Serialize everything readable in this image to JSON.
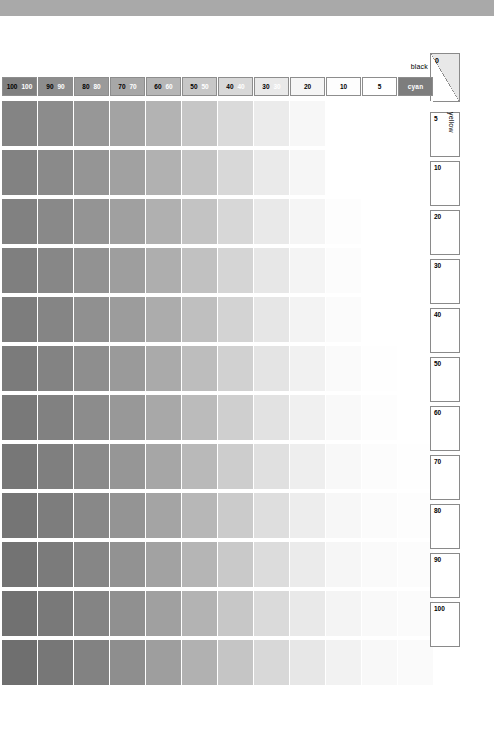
{
  "page": {
    "top_band_color": "#a9a9a9",
    "background": "#ffffff"
  },
  "labels": {
    "black": "black",
    "yellow": "yellow",
    "zero": "0"
  },
  "header": {
    "cells": [
      {
        "dark": "100",
        "light": "100",
        "fill": "#808080",
        "cyan": false
      },
      {
        "dark": "90",
        "light": "90",
        "fill": "#8d8d8d",
        "cyan": false
      },
      {
        "dark": "80",
        "light": "80",
        "fill": "#9a9a9a",
        "cyan": false
      },
      {
        "dark": "70",
        "light": "70",
        "fill": "#a7a7a7",
        "cyan": false
      },
      {
        "dark": "60",
        "light": "60",
        "fill": "#b6b6b6",
        "cyan": false
      },
      {
        "dark": "50",
        "light": "50",
        "fill": "#c7c7c7",
        "cyan": false
      },
      {
        "dark": "40",
        "light": "40",
        "fill": "#d8d8d8",
        "cyan": false
      },
      {
        "dark": "30",
        "light": "30",
        "fill": "#e9e9e9",
        "cyan": false
      },
      {
        "dark": "20",
        "light": "",
        "fill": "#f5f5f5",
        "cyan": false
      },
      {
        "dark": "10",
        "light": "",
        "fill": "#fdfdfd",
        "cyan": false
      },
      {
        "dark": "5",
        "light": "",
        "fill": "#ffffff",
        "cyan": false
      },
      {
        "dark": "cyan",
        "light": "",
        "fill": "#7d7d7d",
        "cyan": true
      }
    ]
  },
  "side_column": {
    "cells": [
      "5",
      "10",
      "20",
      "30",
      "40",
      "50",
      "60",
      "70",
      "80",
      "90",
      "100"
    ]
  },
  "chart_data": {
    "type": "heatmap",
    "xlabel": "cyan",
    "ylabel": "yellow",
    "x_categories": [
      "100",
      "90",
      "80",
      "70",
      "60",
      "50",
      "40",
      "30",
      "20",
      "10",
      "5",
      "cyan"
    ],
    "y_categories": [
      "0",
      "5",
      "10",
      "20",
      "30",
      "40",
      "50",
      "60",
      "70",
      "80",
      "90",
      "100"
    ],
    "grid": false,
    "legend": "none",
    "rows": [
      [
        "#848484",
        "#8c8c8c",
        "#979797",
        "#a3a3a3",
        "#b3b3b3",
        "#c6c6c6",
        "#dadada",
        "#ebebeb",
        "#f7f7f7",
        "#ffffff",
        "#ffffff",
        "#ffffff"
      ],
      [
        "#828282",
        "#8a8a8a",
        "#959595",
        "#a1a1a1",
        "#b1b1b1",
        "#c4c4c4",
        "#d8d8d8",
        "#eaeaea",
        "#f6f6f6",
        "#ffffff",
        "#ffffff",
        "#ffffff"
      ],
      [
        "#818181",
        "#898989",
        "#949494",
        "#a0a0a0",
        "#b0b0b0",
        "#c3c3c3",
        "#d7d7d7",
        "#e9e9e9",
        "#f5f5f5",
        "#fdfdfd",
        "#ffffff",
        "#ffffff"
      ],
      [
        "#7f7f7f",
        "#878787",
        "#929292",
        "#9e9e9e",
        "#aeaeae",
        "#c1c1c1",
        "#d5d5d5",
        "#e7e7e7",
        "#f4f4f4",
        "#fcfcfc",
        "#ffffff",
        "#ffffff"
      ],
      [
        "#7d7d7d",
        "#858585",
        "#909090",
        "#9c9c9c",
        "#acacac",
        "#bfbfbf",
        "#d3d3d3",
        "#e6e6e6",
        "#f3f3f3",
        "#fbfbfb",
        "#ffffff",
        "#ffffff"
      ],
      [
        "#7b7b7b",
        "#838383",
        "#8e8e8e",
        "#9a9a9a",
        "#aaaaaa",
        "#bdbdbd",
        "#d1d1d1",
        "#e4e4e4",
        "#f1f1f1",
        "#fafafa",
        "#fefefe",
        "#ffffff"
      ],
      [
        "#797979",
        "#818181",
        "#8c8c8c",
        "#989898",
        "#a8a8a8",
        "#bbbbbb",
        "#cfcfcf",
        "#e2e2e2",
        "#f0f0f0",
        "#f9f9f9",
        "#fdfdfd",
        "#ffffff"
      ],
      [
        "#777777",
        "#7f7f7f",
        "#8a8a8a",
        "#969696",
        "#a6a6a6",
        "#b9b9b9",
        "#cdcdcd",
        "#e0e0e0",
        "#eeeeee",
        "#f8f8f8",
        "#fcfcfc",
        "#fefefe"
      ],
      [
        "#757575",
        "#7d7d7d",
        "#888888",
        "#949494",
        "#a4a4a4",
        "#b7b7b7",
        "#cbcbcb",
        "#dedede",
        "#ededed",
        "#f7f7f7",
        "#fbfbfb",
        "#fdfdfd"
      ],
      [
        "#737373",
        "#7b7b7b",
        "#868686",
        "#929292",
        "#a2a2a2",
        "#b5b5b5",
        "#c9c9c9",
        "#dcdcdc",
        "#ebebeb",
        "#f6f6f6",
        "#fafafa",
        "#fcfcfc"
      ],
      [
        "#717171",
        "#797979",
        "#848484",
        "#909090",
        "#a0a0a0",
        "#b3b3b3",
        "#c7c7c7",
        "#dadada",
        "#e9e9e9",
        "#f4f4f4",
        "#f9f9f9",
        "#fbfbfb"
      ],
      [
        "#6f6f6f",
        "#777777",
        "#828282",
        "#8e8e8e",
        "#9e9e9e",
        "#b1b1b1",
        "#c5c5c5",
        "#d8d8d8",
        "#e7e7e7",
        "#f2f2f2",
        "#f8f8f8",
        "#fafafa"
      ]
    ]
  }
}
